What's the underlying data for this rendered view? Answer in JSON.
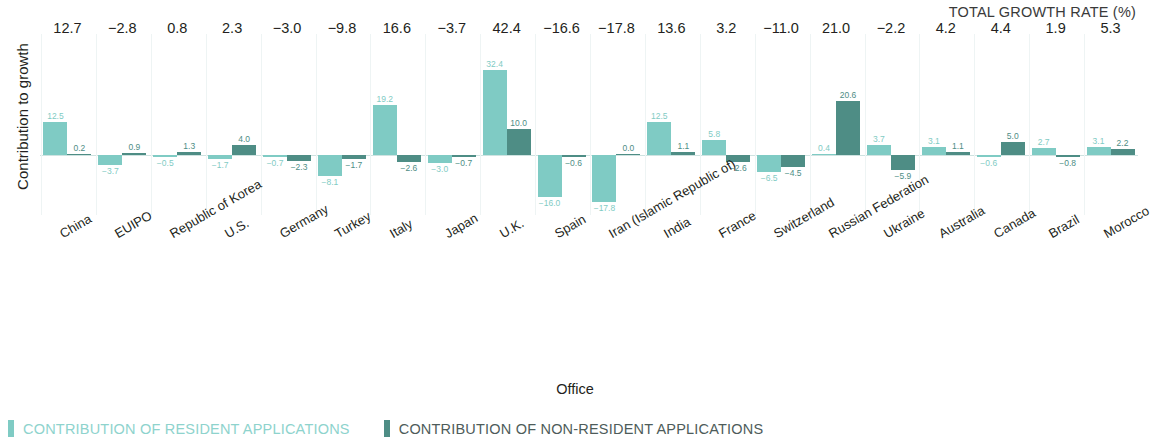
{
  "header": {
    "total_growth_rate_title": "TOTAL GROWTH RATE (%)"
  },
  "axes": {
    "y_title": "Contribution to growth",
    "x_title": "Office"
  },
  "legend": {
    "resident": "CONTRIBUTION OF RESIDENT APPLICATIONS",
    "non_resident": "CONTRIBUTION OF NON-RESIDENT APPLICATIONS",
    "resident_color": "#7fcbc4",
    "non_resident_color": "#4e8d85"
  },
  "chart_data": {
    "type": "bar",
    "title": "TOTAL GROWTH RATE (%)",
    "xlabel": "Office",
    "ylabel": "Contribution to growth",
    "grid": true,
    "legend_position": "bottom-left",
    "categories": [
      "China",
      "EUIPO",
      "Republic of Korea",
      "U.S.",
      "Germany",
      "Turkey",
      "Italy",
      "Japan",
      "U.K.",
      "Spain",
      "Iran (Islamic Republic of)",
      "India",
      "France",
      "Switzerland",
      "Russian Federation",
      "Ukraine",
      "Australia",
      "Canada",
      "Brazil",
      "Morocco"
    ],
    "series": [
      {
        "name": "CONTRIBUTION OF RESIDENT APPLICATIONS",
        "color": "#7fcbc4",
        "values": [
          12.5,
          -3.7,
          -0.5,
          -1.7,
          -0.7,
          -8.1,
          19.2,
          -3.0,
          32.4,
          -16.0,
          -17.8,
          12.5,
          5.8,
          -6.5,
          0.4,
          3.7,
          3.1,
          -0.6,
          2.7,
          3.1
        ],
        "labels": [
          "12.5",
          "−3.7",
          "−0.5",
          "−1.7",
          "−0.7",
          "−8.1",
          "19.2",
          "−3.0",
          "32.4",
          "−16.0",
          "−17.8",
          "12.5",
          "5.8",
          "−6.5",
          "0.4",
          "3.7",
          "3.1",
          "−0.6",
          "2.7",
          "3.1"
        ]
      },
      {
        "name": "CONTRIBUTION OF NON-RESIDENT APPLICATIONS",
        "color": "#4e8d85",
        "values": [
          0.2,
          0.9,
          1.3,
          4.0,
          -2.3,
          -1.7,
          -2.6,
          -0.7,
          10.0,
          -0.6,
          0.0,
          1.1,
          -2.6,
          -4.5,
          20.6,
          -5.9,
          1.1,
          5.0,
          -0.8,
          2.2
        ],
        "labels": [
          "0.2",
          "0.9",
          "1.3",
          "4.0",
          "−2.3",
          "−1.7",
          "−2.6",
          "−0.7",
          "10.0",
          "−0.6",
          "0.0",
          "1.1",
          "−2.6",
          "−4.5",
          "20.6",
          "−5.9",
          "1.1",
          "5.0",
          "−0.8",
          "2.2"
        ]
      }
    ],
    "totals": [
      12.7,
      -2.8,
      0.8,
      2.3,
      -3.0,
      -9.8,
      16.6,
      -3.7,
      42.4,
      -16.6,
      -17.8,
      13.6,
      3.2,
      -11.0,
      21.0,
      -2.2,
      4.2,
      4.4,
      1.9,
      5.3
    ],
    "total_labels": [
      "12.7",
      "−2.8",
      "0.8",
      "2.3",
      "−3.0",
      "−9.8",
      "16.6",
      "−3.7",
      "42.4",
      "−16.6",
      "−17.8",
      "13.6",
      "3.2",
      "−11.0",
      "21.0",
      "−2.2",
      "4.2",
      "4.4",
      "1.9",
      "5.3"
    ]
  }
}
